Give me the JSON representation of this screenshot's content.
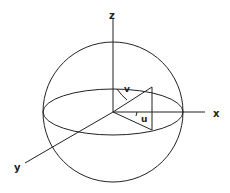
{
  "diagram": {
    "type": "spherical-coordinate-sphere",
    "colors": {
      "stroke": "#222222",
      "background": "#ffffff"
    },
    "sphere": {
      "cx": 113,
      "cy": 112,
      "r": 70
    },
    "equator": {
      "cx": 113,
      "cy": 112,
      "rx": 70,
      "ry": 23
    },
    "axes": {
      "z": {
        "label": "z",
        "x1": 113,
        "y1": 112,
        "x2": 113,
        "y2": 18
      },
      "x": {
        "label": "x",
        "x1": 113,
        "y1": 112,
        "x2": 205,
        "y2": 112
      },
      "y": {
        "label": "y",
        "x1": 113,
        "y1": 112,
        "x2": 25,
        "y2": 163
      }
    },
    "angles": {
      "v": {
        "label": "v"
      },
      "u": {
        "label": "u"
      }
    },
    "triangle": {
      "points": "113,112 152,87 152,130"
    }
  }
}
